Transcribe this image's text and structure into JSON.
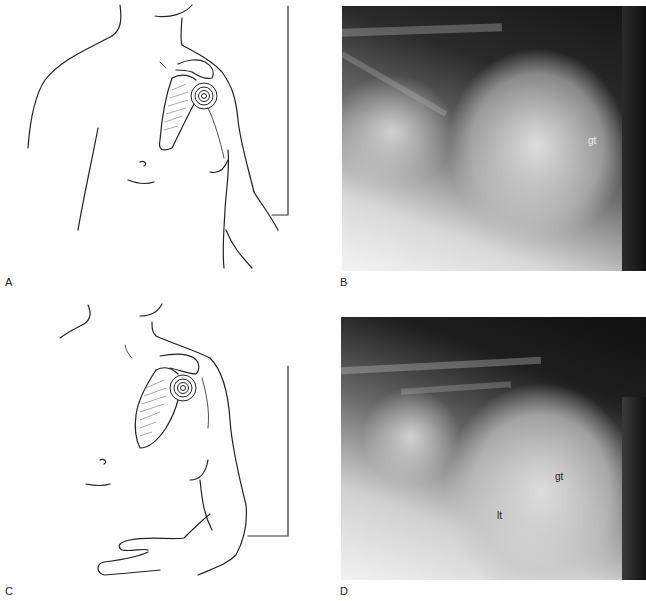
{
  "figure": {
    "panels": [
      {
        "id": "A",
        "type": "illustration",
        "description": "Line drawing of patient torso, front view, with scapula and concentric-circle target over humeral head; vertical cassette line at right"
      },
      {
        "id": "B",
        "type": "radiograph",
        "description": "Shoulder radiograph",
        "annotations": [
          {
            "text": "gt"
          }
        ]
      },
      {
        "id": "C",
        "type": "illustration",
        "description": "Line drawing of patient torso rotated, arm bent across abdomen, with scapula and concentric-circle target"
      },
      {
        "id": "D",
        "type": "radiograph",
        "description": "Shoulder radiograph",
        "annotations": [
          {
            "text": "gt"
          },
          {
            "text": "lt"
          }
        ]
      }
    ],
    "labels": {
      "a": "A",
      "b": "B",
      "c": "C",
      "d": "D"
    },
    "annotations": {
      "b_gt": "gt",
      "d_gt": "gt",
      "d_lt": "lt"
    }
  }
}
